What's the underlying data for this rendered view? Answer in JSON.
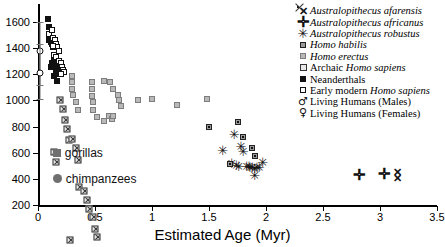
{
  "chart_data": {
    "type": "scatter",
    "title": "",
    "xlabel": "Estimated Age (Myr)",
    "ylabel": "",
    "xlim": [
      0,
      3.5
    ],
    "ylim": [
      200,
      1600
    ],
    "xticks": [
      "0",
      "0.5",
      "1",
      "1.5",
      "2",
      "2.5",
      "3",
      "3.5"
    ],
    "xtick_values": [
      0,
      0.5,
      1,
      1.5,
      2,
      2.5,
      3,
      3.5
    ],
    "yticks": [
      "200",
      "400",
      "600",
      "800",
      "1000",
      "1200",
      "1400",
      "1600"
    ],
    "ytick_values": [
      200,
      400,
      600,
      800,
      1000,
      1200,
      1400,
      1600
    ],
    "grid": false,
    "legend_position": "top-right",
    "series": [
      {
        "name": "Australopithecus afarensis",
        "marker": "cross-x",
        "points": [
          [
            3.15,
            455
          ],
          [
            3.15,
            405
          ]
        ]
      },
      {
        "name": "Australopithecus africanus",
        "marker": "plus",
        "points": [
          [
            2.82,
            430
          ],
          [
            3.04,
            440
          ]
        ]
      },
      {
        "name": "Australopithecus robustus",
        "marker": "star",
        "points": [
          [
            1.62,
            620
          ],
          [
            1.72,
            740
          ],
          [
            1.78,
            650
          ],
          [
            1.8,
            610
          ],
          [
            1.83,
            500
          ],
          [
            1.85,
            495
          ],
          [
            1.86,
            490
          ],
          [
            1.88,
            487
          ],
          [
            1.9,
            485
          ],
          [
            1.92,
            487
          ],
          [
            1.94,
            492
          ],
          [
            1.74,
            505
          ],
          [
            1.76,
            498
          ],
          [
            1.7,
            520
          ],
          [
            1.97,
            530
          ],
          [
            1.9,
            430
          ]
        ]
      },
      {
        "name": "Homo habilis",
        "marker": "square-habilis",
        "points": [
          [
            1.5,
            800
          ],
          [
            1.75,
            880
          ],
          [
            1.8,
            810
          ],
          [
            1.88,
            770
          ],
          [
            1.9,
            760
          ],
          [
            1.68,
            740
          ]
        ]
      },
      {
        "name": "Homo erectus",
        "marker": "square-gray",
        "points": [
          [
            0.3,
            1190
          ],
          [
            0.3,
            1140
          ],
          [
            0.3,
            1090
          ],
          [
            0.31,
            1040
          ],
          [
            0.33,
            990
          ],
          [
            0.35,
            930
          ],
          [
            0.47,
            1140
          ],
          [
            0.47,
            1090
          ],
          [
            0.47,
            1035
          ],
          [
            0.48,
            985
          ],
          [
            0.48,
            930
          ],
          [
            0.52,
            870
          ],
          [
            0.58,
            845
          ],
          [
            0.62,
            880
          ],
          [
            0.65,
            860
          ],
          [
            0.88,
            1000
          ],
          [
            1.0,
            1010
          ],
          [
            1.22,
            965
          ],
          [
            1.48,
            1010
          ],
          [
            0.58,
            1150
          ],
          [
            0.63,
            1140
          ],
          [
            0.66,
            1090
          ],
          [
            0.7,
            1040
          ],
          [
            0.71,
            1000
          ],
          [
            0.73,
            960
          ],
          [
            0.66,
            880
          ]
        ]
      },
      {
        "name": "Archaic Homo sapiens",
        "marker": "square-hatched",
        "points": [
          [
            0.19,
            1280
          ],
          [
            0.22,
            1265
          ],
          [
            0.24,
            1230
          ],
          [
            0.25,
            1215
          ],
          [
            0.27,
            1190
          ],
          [
            0.3,
            1250
          ],
          [
            0.33,
            1230
          ],
          [
            0.35,
            1195
          ],
          [
            0.14,
            1310
          ],
          [
            0.16,
            1290
          ],
          [
            0.36,
            1150
          ],
          [
            0.4,
            1175
          ],
          [
            0.43,
            1160
          ],
          [
            0.45,
            1140
          ],
          [
            0.48,
            1130
          ],
          [
            0.5,
            1095
          ],
          [
            0.52,
            1085
          ],
          [
            0.28,
            1120
          ],
          [
            0.31,
            1080
          ],
          [
            0.26,
            1050
          ]
        ]
      },
      {
        "name": "Neanderthals",
        "marker": "square-black",
        "points": [
          [
            0.09,
            1620
          ],
          [
            0.1,
            1560
          ],
          [
            0.1,
            1490
          ],
          [
            0.1,
            1460
          ],
          [
            0.11,
            1445
          ],
          [
            0.12,
            1430
          ],
          [
            0.13,
            1410
          ],
          [
            0.14,
            1345
          ],
          [
            0.14,
            1300
          ],
          [
            0.15,
            1275
          ],
          [
            0.16,
            1250
          ],
          [
            0.16,
            1230
          ],
          [
            0.17,
            1215
          ],
          [
            0.18,
            1200
          ],
          [
            0.17,
            1150
          ],
          [
            0.14,
            1185
          ],
          [
            0.11,
            1255
          ],
          [
            0.12,
            1290
          ]
        ]
      },
      {
        "name": "Early modern Homo sapiens",
        "marker": "square-open",
        "points": [
          [
            0.1,
            1505
          ],
          [
            0.13,
            1480
          ],
          [
            0.15,
            1465
          ],
          [
            0.16,
            1430
          ],
          [
            0.17,
            1405
          ],
          [
            0.18,
            1375
          ],
          [
            0.14,
            1350
          ],
          [
            0.16,
            1330
          ],
          [
            0.18,
            1305
          ],
          [
            0.2,
            1285
          ],
          [
            0.21,
            1255
          ],
          [
            0.22,
            1235
          ],
          [
            0.23,
            1215
          ],
          [
            0.12,
            1535
          ],
          [
            0.13,
            1420
          ],
          [
            0.2,
            1200
          ]
        ]
      },
      {
        "name": "Living Humans (Males)",
        "marker": "circle-open",
        "points": [
          [
            0.02,
            1375
          ]
        ],
        "error_bar": {
          "x": 0.02,
          "center": 1375,
          "low": 1115,
          "high": 1600
        }
      },
      {
        "name": "Living Humans (Females)",
        "marker": "circle-open",
        "points": [
          [
            0.02,
            1210
          ]
        ],
        "error_bar": {
          "x": 0.02,
          "center": 1210,
          "low": 1010,
          "high": 1430
        }
      }
    ],
    "annotations": [
      {
        "label": "gorillas",
        "marker": "square-darkgray",
        "x": 0.13,
        "y": 595
      },
      {
        "label": "chimpanzees",
        "marker": "circle-darkgray",
        "x": 0.13,
        "y": 400
      }
    ]
  },
  "legend": {
    "items": [
      {
        "marker": "cross-x",
        "prefix": "",
        "italic": "Australopithecus afarensis",
        "suffix": ""
      },
      {
        "marker": "plus",
        "prefix": "",
        "italic": "Australopithecus africanus",
        "suffix": ""
      },
      {
        "marker": "star",
        "prefix": "",
        "italic": "Australopithecus robustus",
        "suffix": ""
      },
      {
        "marker": "square-habilis",
        "prefix": "",
        "italic": "Homo habilis",
        "suffix": ""
      },
      {
        "marker": "square-gray",
        "prefix": "",
        "italic": "Homo erectus",
        "suffix": ""
      },
      {
        "marker": "square-hatched",
        "prefix": "Archaic ",
        "italic": "Homo sapiens",
        "suffix": ""
      },
      {
        "marker": "square-black",
        "prefix": "Neanderthals",
        "italic": "",
        "suffix": ""
      },
      {
        "marker": "square-open",
        "prefix": "Early modern ",
        "italic": "Homo sapiens",
        "suffix": ""
      },
      {
        "marker": "mars",
        "prefix": "Living Humans (Males)",
        "italic": "",
        "suffix": ""
      },
      {
        "marker": "venus",
        "prefix": "Living Humans (Females)",
        "italic": "",
        "suffix": ""
      }
    ]
  },
  "symbols": {
    "cross-x": "✕",
    "plus": "✛",
    "star": "✳",
    "mars": "♂",
    "venus": "♀"
  }
}
